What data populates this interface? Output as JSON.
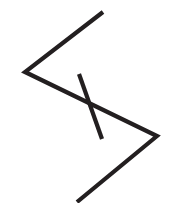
{
  "canvas": {
    "width": 170,
    "height": 203,
    "background_color": "#ffffff",
    "name": "logo-mark-canvas"
  },
  "artwork": {
    "title": "Angular S Chevron Logo Mark",
    "description": "Two dark angular polyline strokes forming a stylized S / double-chevron mark on a plain white background",
    "style": "line-art monogram",
    "stroke_color": "#231f20",
    "stroke_width": 4.2,
    "stroke_linecap": "butt",
    "stroke_linejoin": "miter",
    "text_content": "",
    "strokes": [
      {
        "name": "outer-zigzag-stroke",
        "role": "primary",
        "points": "103,12 25,72 157,136 77,202",
        "vertices": [
          {
            "label": "top-right-terminal",
            "x": 103,
            "y": 12
          },
          {
            "label": "left-apex",
            "x": 25,
            "y": 72
          },
          {
            "label": "right-apex",
            "x": 157,
            "y": 136
          },
          {
            "label": "bottom-left-terminal",
            "x": 77,
            "y": 202
          }
        ]
      },
      {
        "name": "inner-diagonal-stroke",
        "role": "secondary",
        "points": "79,74 102,139",
        "vertices": [
          {
            "label": "inner-top-terminal",
            "x": 79,
            "y": 74
          },
          {
            "label": "inner-bottom-terminal",
            "x": 102,
            "y": 139
          }
        ]
      }
    ]
  }
}
